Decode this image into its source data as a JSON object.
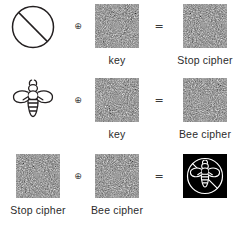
{
  "figure": {
    "type": "xor-cipher-diagram",
    "background_color": "#ffffff",
    "ink_color": "#231f20",
    "noise_color": "#6f6f6f",
    "result_background": "#000000",
    "operator_xor": "⊕",
    "operator_equals": "=",
    "rows": [
      {
        "id": "row-1",
        "operand_a": {
          "kind": "icon",
          "icon": "prohibition-sign-icon",
          "label": ""
        },
        "operator_1": "⊕",
        "operand_b": {
          "kind": "noise",
          "label": "key"
        },
        "operator_2": "=",
        "result": {
          "kind": "noise",
          "label": "Stop cipher"
        }
      },
      {
        "id": "row-2",
        "operand_a": {
          "kind": "icon",
          "icon": "bee-icon",
          "label": ""
        },
        "operator_1": "⊕",
        "operand_b": {
          "kind": "noise",
          "label": "key"
        },
        "operator_2": "=",
        "result": {
          "kind": "noise",
          "label": "Bee cipher"
        }
      },
      {
        "id": "row-3",
        "operand_a": {
          "kind": "noise",
          "label": "Stop cipher"
        },
        "operator_1": "⊕",
        "operand_b": {
          "kind": "noise",
          "label": "Bee cipher"
        },
        "operator_2": "=",
        "result": {
          "kind": "icon-inverted",
          "icon": "bee-in-prohibition-sign-icon",
          "label": ""
        }
      }
    ]
  }
}
